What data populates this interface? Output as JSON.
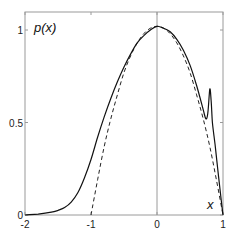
{
  "chart_data": {
    "type": "line",
    "title": "",
    "xlabel": "x",
    "ylabel": "p(x)",
    "xlim": [
      -2,
      1
    ],
    "ylim": [
      0,
      1.1
    ],
    "grid": false,
    "legend": null,
    "xticks": [
      -2,
      -1,
      0,
      1
    ],
    "xtick_labels": [
      "-2",
      "-1",
      "0",
      "1"
    ],
    "yticks": [
      0,
      0.5,
      1
    ],
    "ytick_labels": [
      "0",
      "0.5",
      "1"
    ],
    "reference_lines": [
      {
        "orientation": "vertical",
        "x": 0
      }
    ],
    "series": [
      {
        "name": "solid",
        "style": "solid",
        "color": "#000000",
        "x": [
          -2.0,
          -1.8,
          -1.6,
          -1.5,
          -1.4,
          -1.3,
          -1.2,
          -1.1,
          -1.0,
          -0.9,
          -0.8,
          -0.7,
          -0.6,
          -0.5,
          -0.4,
          -0.3,
          -0.2,
          -0.1,
          0.0,
          0.1,
          0.2,
          0.3,
          0.4,
          0.5,
          0.6,
          0.7,
          0.74,
          0.77,
          0.8,
          0.82,
          0.84,
          0.88,
          0.92,
          0.96,
          1.0
        ],
        "y": [
          0.0,
          0.005,
          0.015,
          0.025,
          0.04,
          0.07,
          0.12,
          0.2,
          0.3,
          0.42,
          0.53,
          0.63,
          0.72,
          0.8,
          0.87,
          0.93,
          0.97,
          1.0,
          1.02,
          1.01,
          0.99,
          0.95,
          0.89,
          0.81,
          0.7,
          0.57,
          0.52,
          0.55,
          0.68,
          0.62,
          0.5,
          0.38,
          0.25,
          0.12,
          0.0
        ]
      },
      {
        "name": "dashed",
        "style": "dashed",
        "color": "#000000",
        "x": [
          -1.0,
          -0.9,
          -0.8,
          -0.7,
          -0.6,
          -0.5,
          -0.4,
          -0.3,
          -0.2,
          -0.1,
          0.0,
          0.1,
          0.2,
          0.3,
          0.4,
          0.5,
          0.6,
          0.7,
          0.8,
          0.9,
          1.0
        ],
        "y": [
          0.0,
          0.19,
          0.37,
          0.52,
          0.65,
          0.77,
          0.86,
          0.93,
          0.98,
          1.01,
          1.02,
          1.01,
          0.98,
          0.93,
          0.86,
          0.77,
          0.65,
          0.52,
          0.37,
          0.19,
          0.0
        ]
      }
    ]
  }
}
